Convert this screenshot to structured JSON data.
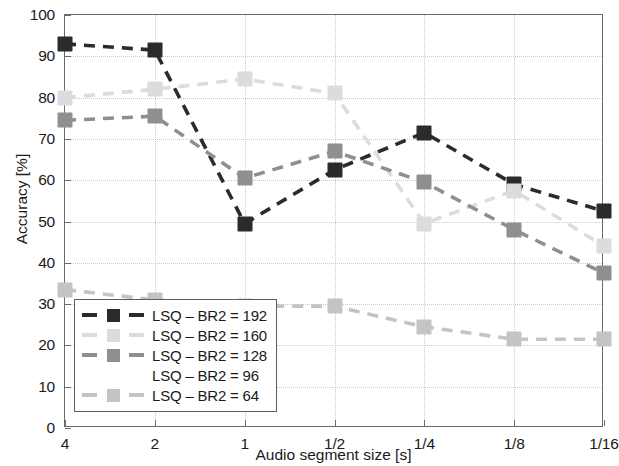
{
  "chart_data": {
    "type": "line",
    "title": "",
    "xlabel": "Audio segment size [s]",
    "ylabel": "Accuracy [%]",
    "categories": [
      "4",
      "2",
      "1",
      "1/2",
      "1/4",
      "1/8",
      "1/16"
    ],
    "ylim": [
      0,
      100
    ],
    "yticks": [
      0,
      10,
      20,
      30,
      40,
      50,
      60,
      70,
      80,
      90,
      100
    ],
    "grid": true,
    "legend_position": "lower-left inside axes",
    "marker": "square",
    "linestyle": "dashed",
    "series": [
      {
        "name": "LSQ – BR2 = 192",
        "color": "#2b2b2b",
        "values": [
          93.0,
          91.5,
          49.5,
          62.5,
          71.5,
          59.0,
          52.5
        ]
      },
      {
        "name": "LSQ – BR2 = 160",
        "color": "#dcdcdc",
        "values": [
          80.0,
          82.0,
          84.5,
          81.0,
          49.5,
          57.5,
          44.0
        ]
      },
      {
        "name": "LSQ – BR2 = 128",
        "color": "#8f8f8f",
        "values": [
          74.5,
          75.5,
          60.5,
          67.0,
          59.5,
          48.0,
          37.5
        ]
      },
      {
        "name": "LSQ – BR2 = 96",
        "color": "#ffffff",
        "values": [
          null,
          null,
          null,
          null,
          null,
          null,
          null
        ]
      },
      {
        "name": "LSQ – BR2 = 64",
        "color": "#c4c4c4",
        "values": [
          33.5,
          31.0,
          29.5,
          29.5,
          24.5,
          21.5,
          21.5
        ]
      }
    ]
  },
  "axes": {
    "y_tick_labels": [
      "100",
      "90",
      "80",
      "70",
      "60",
      "50",
      "40",
      "30",
      "20",
      "10",
      "0"
    ],
    "x_tick_labels": [
      "4",
      "2",
      "1",
      "1/2",
      "1/4",
      "1/8",
      "1/16"
    ],
    "x_title": "Audio segment size [s]",
    "y_title": "Accuracy [%]"
  },
  "legend": {
    "items": [
      {
        "label": "LSQ – BR2 = 192",
        "color": "#2b2b2b"
      },
      {
        "label": "LSQ – BR2 = 160",
        "color": "#dcdcdc"
      },
      {
        "label": "LSQ – BR2 = 128",
        "color": "#8f8f8f"
      },
      {
        "label": "LSQ – BR2 = 96",
        "color": "#ffffff"
      },
      {
        "label": "LSQ – BR2 = 64",
        "color": "#c4c4c4"
      }
    ]
  }
}
